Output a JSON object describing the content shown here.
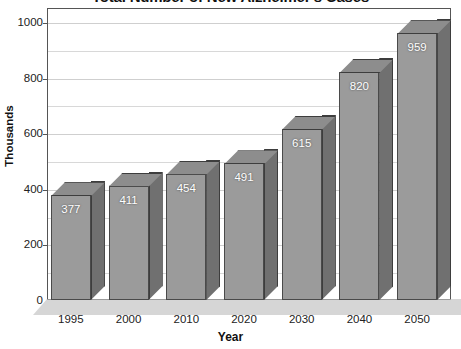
{
  "chart_data": {
    "type": "bar",
    "title": "Total Number of New Alzheimer's Cases",
    "xlabel": "Year",
    "ylabel": "Thousands",
    "categories": [
      "1995",
      "2000",
      "2010",
      "2020",
      "2030",
      "2040",
      "2050"
    ],
    "values": [
      377,
      411,
      454,
      491,
      615,
      820,
      959
    ],
    "value_labels": [
      "377",
      "411",
      "454",
      "491",
      "615",
      "820",
      "959"
    ],
    "ylim": [
      0,
      1050
    ],
    "y_major_ticks": [
      0,
      200,
      400,
      600,
      800,
      1000
    ],
    "y_major_tick_labels": [
      "0",
      "200",
      "400",
      "600",
      "800",
      "1000"
    ],
    "y_minor_ticks": [
      100,
      300,
      500,
      700,
      900
    ],
    "grid": true,
    "grid_axis": "y",
    "legend": false,
    "legend_position": "none",
    "style": "3d-column",
    "colors": {
      "bar_front": "#9b9b9b",
      "bar_side": "#707070",
      "bar_top": "#8d8d8d",
      "bar_outline": "#4a4a4a",
      "value_label": "#ffffff",
      "gridline": "#d8d8d8",
      "frame": "#555555",
      "floor": "#d6d6d6",
      "background": "#ffffff",
      "text": "#111111"
    }
  }
}
